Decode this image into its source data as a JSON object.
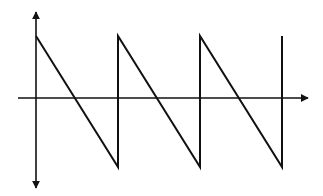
{
  "diagram": {
    "colors": {
      "stroke": "#111111",
      "background": "#ffffff"
    },
    "axes": {
      "y_axis": {
        "x": 36,
        "y_top": 12,
        "y_bottom": 188,
        "arrows": [
          "up",
          "down"
        ]
      },
      "x_axis": {
        "y": 98,
        "x_start": 18,
        "x_end": 310,
        "arrows": [
          "right"
        ]
      }
    },
    "waveform": {
      "type": "sawtooth",
      "cycles": 3,
      "points": "36,36 118,167 118,36 200,167 200,36 282,167 282,36"
    }
  }
}
